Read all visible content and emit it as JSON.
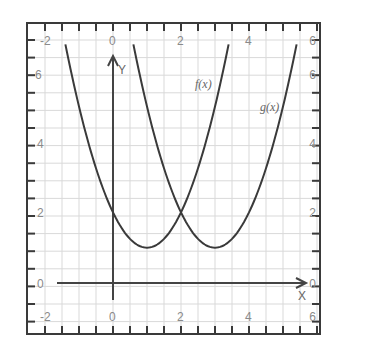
{
  "chart_data": {
    "type": "line",
    "title": "",
    "xlabel": "X",
    "ylabel": "Y",
    "xlim": [
      -2.5,
      6.1
    ],
    "ylim": [
      -2.5,
      6.8
    ],
    "grid": true,
    "grid_step": 0.5,
    "x_ticks_top": [
      "-2",
      "0",
      "2",
      "4",
      "6"
    ],
    "x_ticks_bottom": [
      "-2",
      "0",
      "2",
      "4",
      "6"
    ],
    "y_ticks_left": [
      "-2",
      "6",
      "4",
      "2",
      "0",
      "-2"
    ],
    "y_ticks_right": [
      "6",
      "6",
      "4",
      "2",
      "0",
      "6"
    ],
    "series": [
      {
        "name": "f(x)",
        "expression": "(x-1)^2+1",
        "x": [
          -1.4,
          -1,
          0,
          1,
          2,
          3,
          3.4
        ],
        "y": [
          6.76,
          5,
          2,
          1,
          2,
          5,
          6.76
        ]
      },
      {
        "name": "g(x)",
        "expression": "(x-3)^2+1",
        "x": [
          0.6,
          1,
          2,
          3,
          4,
          5,
          5.4
        ],
        "y": [
          6.76,
          5,
          2,
          1,
          2,
          5,
          6.76
        ]
      }
    ],
    "annotations": [
      {
        "text": "f(x)",
        "x": 2.6,
        "y": 5.7
      },
      {
        "text": "g(x)",
        "x": 4.8,
        "y": 4.8
      },
      {
        "text": "intersection",
        "x": 2,
        "y": 2
      }
    ]
  },
  "labels": {
    "x_axis": "X",
    "y_axis": "Y",
    "f": "f(x)",
    "g": "g(x)",
    "top": [
      "-2",
      "0",
      "2",
      "4",
      "6"
    ],
    "bottom": [
      "-2",
      "0",
      "2",
      "4",
      "6"
    ],
    "left": [
      "-2",
      "6",
      "4",
      "2",
      "0",
      "-2"
    ],
    "right": [
      "6",
      "6",
      "4",
      "2",
      "0",
      "6"
    ]
  }
}
